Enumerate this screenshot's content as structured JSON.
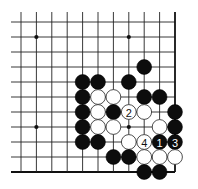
{
  "board": {
    "columns": 11,
    "rows": 11,
    "origin": {
      "x": 21,
      "y": 22
    },
    "spacing": {
      "x": 15.4,
      "y": 15
    },
    "line_extent": {
      "left": 11,
      "top": 12
    },
    "edges": [
      "right",
      "bottom"
    ],
    "star_points": [
      [
        1,
        1
      ],
      [
        7,
        1
      ],
      [
        1,
        7
      ],
      [
        7,
        7
      ]
    ],
    "stone_radius": 7.4
  },
  "stones": [
    {
      "color": "black",
      "col": 8,
      "row": 3
    },
    {
      "color": "black",
      "col": 4,
      "row": 4
    },
    {
      "color": "black",
      "col": 5,
      "row": 4
    },
    {
      "color": "black",
      "col": 7,
      "row": 4
    },
    {
      "color": "black",
      "col": 4,
      "row": 5
    },
    {
      "color": "white",
      "col": 5,
      "row": 5
    },
    {
      "color": "white",
      "col": 6,
      "row": 5
    },
    {
      "color": "black",
      "col": 8,
      "row": 5
    },
    {
      "color": "black",
      "col": 9,
      "row": 5
    },
    {
      "color": "black",
      "col": 4,
      "row": 6
    },
    {
      "color": "white",
      "col": 5,
      "row": 6
    },
    {
      "color": "black",
      "col": 6,
      "row": 6
    },
    {
      "color": "white",
      "col": 7,
      "row": 6,
      "label": "2"
    },
    {
      "color": "white",
      "col": 8,
      "row": 6
    },
    {
      "color": "black",
      "col": 10,
      "row": 6
    },
    {
      "color": "black",
      "col": 4,
      "row": 7
    },
    {
      "color": "white",
      "col": 5,
      "row": 7
    },
    {
      "color": "white",
      "col": 6,
      "row": 7
    },
    {
      "color": "white",
      "col": 9,
      "row": 7
    },
    {
      "color": "black",
      "col": 10,
      "row": 7
    },
    {
      "color": "black",
      "col": 4,
      "row": 8
    },
    {
      "color": "black",
      "col": 5,
      "row": 8
    },
    {
      "color": "white",
      "col": 7,
      "row": 8
    },
    {
      "color": "white",
      "col": 8,
      "row": 8,
      "label": "4"
    },
    {
      "color": "black",
      "col": 9,
      "row": 8,
      "label": "1"
    },
    {
      "color": "black",
      "col": 10,
      "row": 8,
      "label": "3"
    },
    {
      "color": "black",
      "col": 6,
      "row": 9
    },
    {
      "color": "black",
      "col": 7,
      "row": 9
    },
    {
      "color": "white",
      "col": 8,
      "row": 9
    },
    {
      "color": "white",
      "col": 9,
      "row": 9
    },
    {
      "color": "white",
      "col": 10,
      "row": 9
    },
    {
      "color": "black",
      "col": 8,
      "row": 10
    },
    {
      "color": "black",
      "col": 9,
      "row": 10
    }
  ],
  "move_labels": [
    "1",
    "2",
    "3",
    "4"
  ]
}
